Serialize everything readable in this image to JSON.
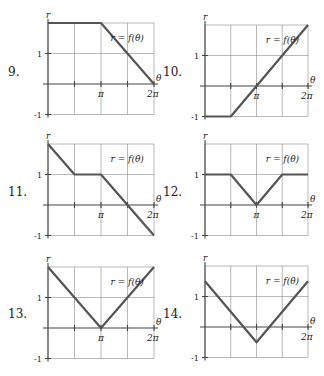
{
  "chart_data": [
    {
      "id": "9",
      "type": "line",
      "title": "",
      "label": "r = f(θ)",
      "xlabel": "θ",
      "ylabel": "r",
      "xticks": [
        "π",
        "2π"
      ],
      "yticks": [
        "1",
        "-1"
      ],
      "xlim": [
        0,
        6.2832
      ],
      "ylim": [
        -1,
        2
      ],
      "grid": true,
      "points": [
        [
          0,
          2
        ],
        [
          3.1416,
          2
        ],
        [
          6.2832,
          0
        ]
      ]
    },
    {
      "id": "10",
      "type": "line",
      "title": "",
      "label": "r = f(θ)",
      "xlabel": "θ",
      "ylabel": "r",
      "xticks": [
        "π",
        "2π"
      ],
      "yticks": [
        "1",
        "-1"
      ],
      "xlim": [
        0,
        6.2832
      ],
      "ylim": [
        -1,
        2
      ],
      "grid": true,
      "points": [
        [
          0,
          -1
        ],
        [
          1.5708,
          -1
        ],
        [
          6.2832,
          2
        ]
      ]
    },
    {
      "id": "11",
      "type": "line",
      "title": "",
      "label": "r = f(θ)",
      "xlabel": "θ",
      "ylabel": "r",
      "xticks": [
        "π",
        "2π"
      ],
      "yticks": [
        "1",
        "-1"
      ],
      "xlim": [
        0,
        6.2832
      ],
      "ylim": [
        -1,
        2
      ],
      "grid": true,
      "points": [
        [
          0,
          2
        ],
        [
          1.5708,
          1
        ],
        [
          3.1416,
          1
        ],
        [
          4.7124,
          0
        ],
        [
          6.2832,
          -1
        ]
      ]
    },
    {
      "id": "12",
      "type": "line",
      "title": "",
      "label": "r = f(θ)",
      "xlabel": "θ",
      "ylabel": "r",
      "xticks": [
        "π",
        "2π"
      ],
      "yticks": [
        "1",
        "-1"
      ],
      "xlim": [
        0,
        6.2832
      ],
      "ylim": [
        -1,
        2
      ],
      "grid": true,
      "points": [
        [
          0,
          1
        ],
        [
          1.5708,
          1
        ],
        [
          3.1416,
          0
        ],
        [
          4.7124,
          1
        ],
        [
          6.2832,
          1
        ]
      ]
    },
    {
      "id": "13",
      "type": "line",
      "title": "",
      "label": "r = f(θ)",
      "xlabel": "θ",
      "ylabel": "r",
      "xticks": [
        "π",
        "2π"
      ],
      "yticks": [
        "1",
        "-1"
      ],
      "xlim": [
        0,
        6.2832
      ],
      "ylim": [
        -1,
        2
      ],
      "grid": true,
      "points": [
        [
          0,
          2
        ],
        [
          3.1416,
          0
        ],
        [
          6.2832,
          2
        ]
      ]
    },
    {
      "id": "14",
      "type": "line",
      "title": "",
      "label": "r = f(θ)",
      "xlabel": "θ",
      "ylabel": "r",
      "xticks": [
        "2π"
      ],
      "yticks": [
        "1",
        "-1"
      ],
      "xlim": [
        0,
        6.2832
      ],
      "ylim": [
        -1,
        2
      ],
      "grid": true,
      "points": [
        [
          0,
          1.5
        ],
        [
          3.1416,
          -0.5
        ],
        [
          6.2832,
          1.5
        ]
      ]
    }
  ],
  "panels": [
    {
      "number": "9.",
      "func_label": "r = f(θ)",
      "r_label": "r",
      "theta_label": "θ",
      "pi_label": "π",
      "two_pi_label": "2π",
      "one_label": "1",
      "neg_one_label": "-1"
    },
    {
      "number": "10.",
      "func_label": "r = f(θ)",
      "r_label": "r",
      "theta_label": "θ",
      "pi_label": "π",
      "two_pi_label": "2π",
      "one_label": "1",
      "neg_one_label": "-1"
    },
    {
      "number": "11.",
      "func_label": "r = f(θ)",
      "r_label": "r",
      "theta_label": "θ",
      "pi_label": "π",
      "two_pi_label": "2π",
      "one_label": "1",
      "neg_one_label": "-1"
    },
    {
      "number": "12.",
      "func_label": "r = f(θ)",
      "r_label": "r",
      "theta_label": "θ",
      "pi_label": "π",
      "two_pi_label": "2π",
      "one_label": "1",
      "neg_one_label": "-1"
    },
    {
      "number": "13.",
      "func_label": "r = f(θ)",
      "r_label": "r",
      "theta_label": "θ",
      "pi_label": "π",
      "two_pi_label": "2π",
      "one_label": "1",
      "neg_one_label": "-1"
    },
    {
      "number": "14.",
      "func_label": "r = f(θ)",
      "r_label": "r",
      "theta_label": "θ",
      "pi_label": "",
      "two_pi_label": "2π",
      "one_label": "1",
      "neg_one_label": "-1"
    }
  ]
}
